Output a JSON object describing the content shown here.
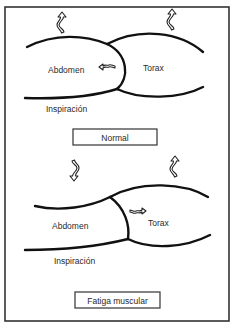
{
  "figure": {
    "panels": [
      {
        "id": "normal",
        "caption": "Normal",
        "labels": {
          "abdomen": "Abdomen",
          "torax": "Torax",
          "phase": "Inspiración"
        },
        "arrows": {
          "abdomen": "up",
          "torax": "up",
          "between": "toward-abdomen"
        }
      },
      {
        "id": "fatiga",
        "caption": "Fatiga muscular",
        "labels": {
          "abdomen": "Abdomen",
          "torax": "Torax",
          "phase": "Inspiración"
        },
        "arrows": {
          "abdomen": "down",
          "torax": "up",
          "between": "toward-torax"
        }
      }
    ],
    "colors": {
      "line": "#111111",
      "frame": "#333333",
      "text": "#2a2a2a",
      "background": "#ffffff"
    }
  }
}
